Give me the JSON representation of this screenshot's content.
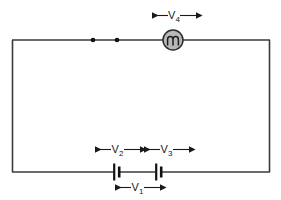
{
  "diagram": {
    "type": "electrical-circuit-schematic",
    "title_faint": "",
    "background_color": "#ffffff",
    "wire_color": "#3a3a3a",
    "component_fill": "#b8b8b8",
    "label_color": "#1a1a1a",
    "loop": {
      "name": "circuit-loop",
      "x": 12,
      "y": 40,
      "width": 258,
      "height": 132
    },
    "components": [
      {
        "id": "junction-dot-1",
        "kind": "junction-dot",
        "cx": 93,
        "cy": 40,
        "r": 2.2
      },
      {
        "id": "junction-dot-2",
        "kind": "junction-dot",
        "cx": 117,
        "cy": 40,
        "r": 2.2
      },
      {
        "id": "lamp",
        "kind": "lamp",
        "cx": 173,
        "cy": 40,
        "r": 10,
        "label": "V4"
      },
      {
        "id": "cell-left",
        "kind": "battery-cell",
        "cx": 116,
        "cy": 172,
        "label": "V2"
      },
      {
        "id": "cell-right",
        "kind": "battery-cell",
        "cx": 158,
        "cy": 172,
        "label": "V3"
      }
    ],
    "measurements": [
      {
        "id": "measure-v4",
        "base": "V",
        "subscript": "4",
        "text": "V4",
        "position": "above-lamp",
        "x1": 152,
        "x2": 196,
        "y": 16,
        "label_x": 173,
        "label_y": 14
      },
      {
        "id": "measure-v2",
        "base": "V",
        "subscript": "2",
        "text": "V2",
        "position": "above-left-cell",
        "x1": 95,
        "x2": 140,
        "y": 150,
        "label_x": 117,
        "label_y": 148
      },
      {
        "id": "measure-v3",
        "base": "V",
        "subscript": "3",
        "text": "V3",
        "position": "above-right-cell",
        "x1": 143,
        "x2": 190,
        "y": 150,
        "label_x": 166,
        "label_y": 148
      },
      {
        "id": "measure-v1",
        "base": "V",
        "subscript": "1",
        "text": "V1",
        "position": "below-cells",
        "x1": 113,
        "x2": 162,
        "y": 188,
        "label_x": 137,
        "label_y": 186
      }
    ],
    "labels": {
      "v1": "V",
      "v1_sub": "1",
      "v2": "V",
      "v2_sub": "2",
      "v3": "V",
      "v3_sub": "3",
      "v4": "V",
      "v4_sub": "4"
    }
  }
}
